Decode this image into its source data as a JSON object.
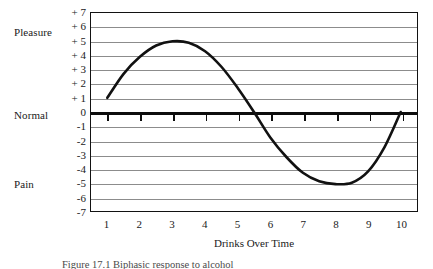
{
  "chart_data": {
    "type": "line",
    "title": "",
    "xlabel": "Drinks Over Time",
    "ylabel": "",
    "xlim": [
      0.5,
      10.5
    ],
    "ylim": [
      -7,
      7
    ],
    "grid": true,
    "legend": "none",
    "x_tick_labels": [
      "1",
      "2",
      "3",
      "4",
      "5",
      "6",
      "7",
      "8",
      "9",
      "10"
    ],
    "x_ticks": [
      1,
      2,
      3,
      4,
      5,
      6,
      7,
      8,
      9,
      10
    ],
    "y_tick_labels": [
      "+ 7",
      "+ 6",
      "+ 5",
      "+ 4",
      "+ 3",
      "+ 2",
      "+ 1",
      "0",
      "-1",
      "-2",
      "-3",
      "-4",
      "-5",
      "-6",
      "-7"
    ],
    "y_ticks": [
      7,
      6,
      5,
      4,
      3,
      2,
      1,
      0,
      -1,
      -2,
      -3,
      -4,
      -5,
      -6,
      -7
    ],
    "zero_axis_label": "Normal",
    "region_labels": [
      {
        "text": "Pleasure",
        "value": 6
      },
      {
        "text": "Normal",
        "value": 0
      },
      {
        "text": "Pain",
        "value": -5
      }
    ],
    "series": [
      {
        "name": "Pleasure-Pain Curve",
        "color": "#111111",
        "points": [
          {
            "x": 1.0,
            "y": 1.0
          },
          {
            "x": 1.5,
            "y": 2.7
          },
          {
            "x": 2.0,
            "y": 3.9
          },
          {
            "x": 2.5,
            "y": 4.7
          },
          {
            "x": 3.0,
            "y": 5.0
          },
          {
            "x": 3.5,
            "y": 4.9
          },
          {
            "x": 4.0,
            "y": 4.3
          },
          {
            "x": 4.5,
            "y": 3.2
          },
          {
            "x": 5.0,
            "y": 1.7
          },
          {
            "x": 5.5,
            "y": 0.0
          },
          {
            "x": 6.0,
            "y": -1.8
          },
          {
            "x": 6.5,
            "y": -3.2
          },
          {
            "x": 7.0,
            "y": -4.3
          },
          {
            "x": 7.5,
            "y": -4.9
          },
          {
            "x": 8.0,
            "y": -5.1
          },
          {
            "x": 8.5,
            "y": -5.0
          },
          {
            "x": 9.0,
            "y": -4.2
          },
          {
            "x": 9.5,
            "y": -2.5
          },
          {
            "x": 10.0,
            "y": 0.0
          }
        ]
      }
    ]
  },
  "caption": {
    "text": "Figure 17.1   Biphasic response to alcohol"
  }
}
